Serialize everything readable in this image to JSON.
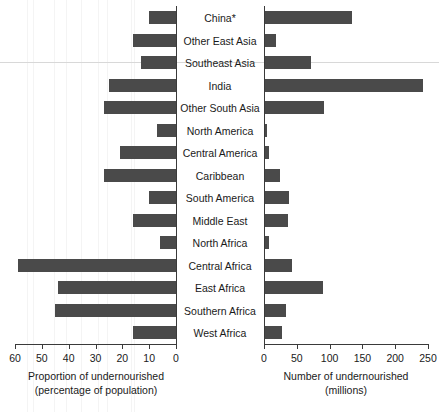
{
  "chart_data": {
    "type": "bar",
    "title": "",
    "orientation": "horizontal-diverging",
    "categories": [
      "China*",
      "Other East Asia",
      "Southeast Asia",
      "India",
      "Other South Asia",
      "North America",
      "Central America",
      "Caribbean",
      "South America",
      "Middle East",
      "North Africa",
      "Central Africa",
      "East Africa",
      "Southern Africa",
      "West Africa"
    ],
    "series": [
      {
        "name": "Proportion of undernourished (percentage of population)",
        "axis": "left",
        "unit": "percent",
        "values": [
          10,
          16,
          13,
          25,
          27,
          7,
          21,
          27,
          10,
          16,
          6,
          59,
          44,
          45,
          16
        ]
      },
      {
        "name": "Number of undernourished (millions)",
        "axis": "right",
        "unit": "millions",
        "values": [
          134,
          18,
          72,
          242,
          92,
          5,
          8,
          25,
          38,
          37,
          7,
          42,
          90,
          34,
          28
        ]
      }
    ],
    "left_axis": {
      "label_line1": "Proportion of undernourished",
      "label_line2": "(percentage of population)",
      "ticks": [
        60,
        50,
        40,
        30,
        20,
        10,
        0
      ],
      "min": 0,
      "max": 60,
      "reversed": true
    },
    "right_axis": {
      "label_line1": "Number of undernourished",
      "label_line2": "(millions)",
      "ticks": [
        0,
        50,
        100,
        150,
        200,
        250
      ],
      "min": 0,
      "max": 250,
      "reversed": false
    },
    "grid": true,
    "legend": "none",
    "colors": {
      "bar": "#4a4a4a",
      "panel_background": "#e9e9e9",
      "gridline": "#f4f4f4",
      "axis": "#3a3a3a",
      "text": "#1a1a1a",
      "label_band": "#ffffff"
    }
  }
}
